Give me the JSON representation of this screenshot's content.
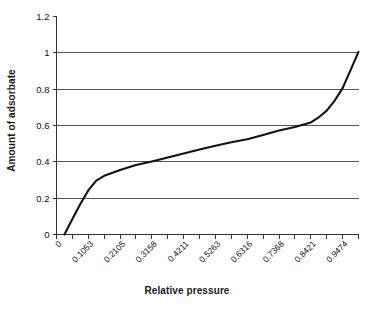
{
  "chart_data": {
    "type": "line",
    "title": "",
    "xlabel": "Relative pressure",
    "ylabel": "Amount of adsorbate",
    "xlim": [
      0,
      1
    ],
    "ylim": [
      0,
      1.2
    ],
    "grid": "horizontal",
    "legend": "none",
    "x_tick_labels": [
      "0",
      "0.1053",
      "0.2105",
      "0.3158",
      "0.4211",
      "0.5263",
      "0.6316",
      "0.7368",
      "0.8421",
      "0.9474"
    ],
    "x_tick_values": [
      0,
      0.1053,
      0.2105,
      0.3158,
      0.4211,
      0.5263,
      0.6316,
      0.7368,
      0.8421,
      0.9474
    ],
    "y_tick_labels": [
      "0",
      "0.2",
      "0.4",
      "0.6",
      "0.8",
      "1",
      "1.2"
    ],
    "y_tick_values": [
      0,
      0.2,
      0.4,
      0.6,
      0.8,
      1,
      1.2
    ],
    "x": [
      0.0263,
      0.0526,
      0.0789,
      0.1053,
      0.1316,
      0.1579,
      0.2105,
      0.2632,
      0.3158,
      0.3684,
      0.4211,
      0.4737,
      0.5263,
      0.5789,
      0.6316,
      0.6842,
      0.7368,
      0.7895,
      0.8421,
      0.8684,
      0.8947,
      0.9211,
      0.9474,
      0.9737,
      1.0
    ],
    "y": [
      0.0,
      0.085,
      0.168,
      0.243,
      0.297,
      0.323,
      0.355,
      0.382,
      0.402,
      0.424,
      0.446,
      0.468,
      0.489,
      0.508,
      0.524,
      0.548,
      0.572,
      0.592,
      0.617,
      0.645,
      0.682,
      0.737,
      0.806,
      0.905,
      1.005
    ],
    "series": [
      {
        "name": "adsorption isotherm",
        "color": "#111111",
        "values": [
          0.0,
          0.085,
          0.168,
          0.243,
          0.297,
          0.323,
          0.355,
          0.382,
          0.402,
          0.424,
          0.446,
          0.468,
          0.489,
          0.508,
          0.524,
          0.548,
          0.572,
          0.592,
          0.617,
          0.645,
          0.682,
          0.737,
          0.806,
          0.905,
          1.005
        ]
      }
    ],
    "colors": {
      "line": "#111111",
      "grid": "#555555",
      "axis": "#333333",
      "text": "#111111",
      "background": "#ffffff"
    }
  },
  "axes": {
    "x_title": "Relative pressure",
    "y_title": "Amount of adsorbate"
  }
}
